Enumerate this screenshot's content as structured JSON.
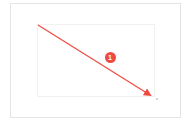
{
  "annotation": {
    "type": "drag-arrow",
    "color": "#ef4a3f",
    "start": {
      "x": 38,
      "y": 25
    },
    "end": {
      "x": 153,
      "y": 97
    },
    "step_badge": {
      "label": "1",
      "x": 110,
      "y": 57
    }
  },
  "icons": {
    "arrow": "arrow-icon",
    "badge": "step-number-badge"
  }
}
